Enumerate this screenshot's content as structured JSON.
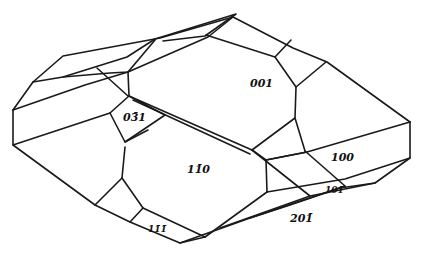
{
  "figure": {
    "type": "crystal-drawing",
    "line_color": "#1a1a1a",
    "background": "#ffffff"
  },
  "faces": [
    {
      "id": "face-001",
      "label": "001",
      "x": 250,
      "y": 87
    },
    {
      "id": "face-0-3bar-1",
      "label": "03̄1",
      "x": 123,
      "y": 121
    },
    {
      "id": "face-1-1bar-0",
      "label": "11̄0",
      "x": 187,
      "y": 173
    },
    {
      "id": "face-100",
      "label": "100",
      "x": 331,
      "y": 161
    },
    {
      "id": "face-101",
      "label": "101",
      "x": 327,
      "y": 193
    },
    {
      "id": "face-2-0-1bar",
      "label": "201̄",
      "x": 290,
      "y": 221
    },
    {
      "id": "face-1-1bar-1bar",
      "label": "11̄1̄",
      "x": 150,
      "y": 231
    }
  ]
}
